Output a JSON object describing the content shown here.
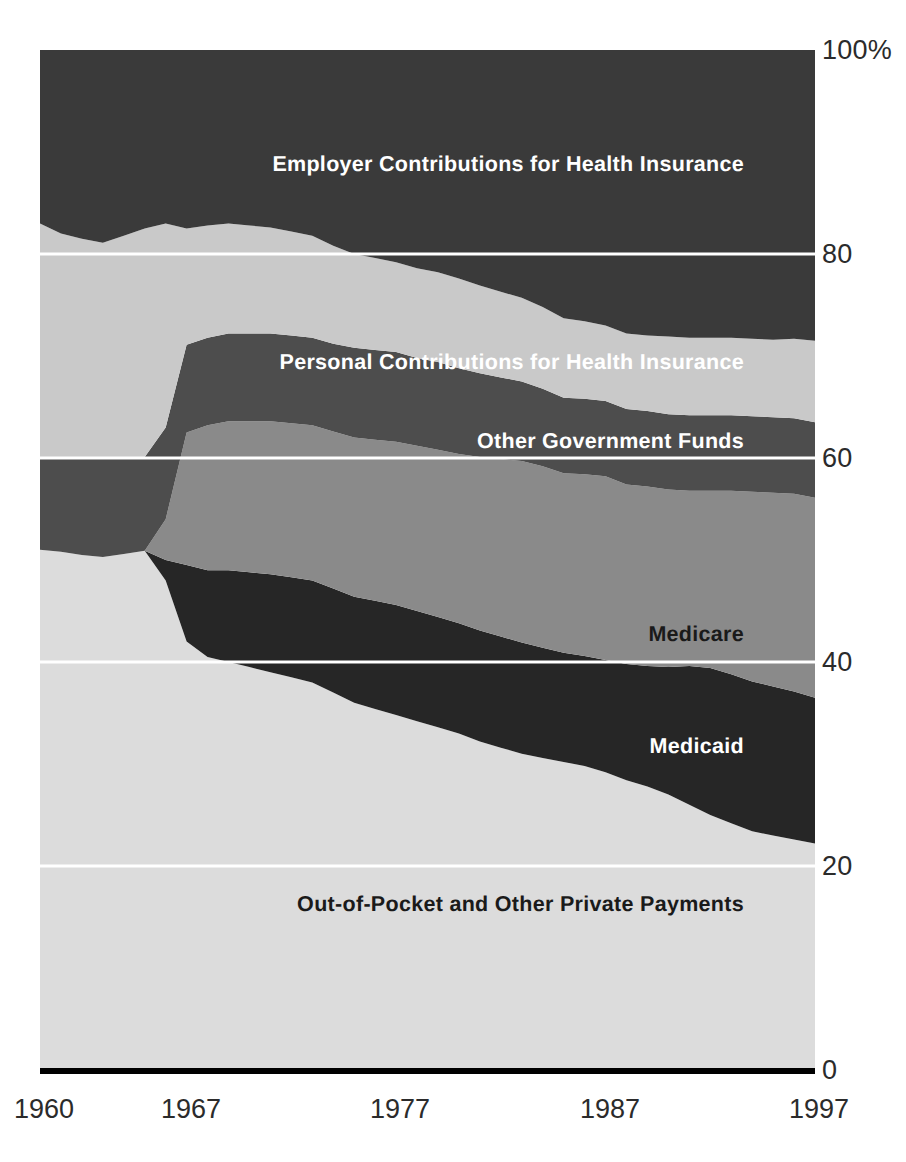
{
  "chart_data": {
    "type": "area",
    "title": "",
    "subtitle": "",
    "xlabel": "",
    "ylabel": "",
    "stacked": true,
    "stack_order": "bottom-to-top",
    "grid": true,
    "legend_position": "inline-labels",
    "xlim": [
      1960,
      1997
    ],
    "ylim": [
      0,
      100
    ],
    "x": [
      1960,
      1961,
      1962,
      1963,
      1964,
      1965,
      1966,
      1967,
      1968,
      1969,
      1970,
      1971,
      1972,
      1973,
      1974,
      1975,
      1976,
      1977,
      1978,
      1979,
      1980,
      1981,
      1982,
      1983,
      1984,
      1985,
      1986,
      1987,
      1988,
      1989,
      1990,
      1991,
      1992,
      1993,
      1994,
      1995,
      1996,
      1997
    ],
    "series": [
      {
        "name": "Out-of-Pocket and Other Private Payments",
        "color": "#dcdcdc",
        "label_color": "#1a1a1a",
        "values": [
          51.0,
          50.8,
          50.5,
          50.3,
          50.6,
          50.9,
          48.0,
          42.0,
          40.5,
          40.0,
          39.5,
          39.0,
          38.5,
          38.0,
          37.0,
          36.0,
          35.4,
          34.8,
          34.2,
          33.6,
          33.0,
          32.2,
          31.6,
          31.0,
          30.6,
          30.2,
          29.8,
          29.2,
          28.4,
          27.8,
          27.0,
          26.0,
          25.0,
          24.2,
          23.4,
          23.0,
          22.6,
          22.2
        ]
      },
      {
        "name": "Medicaid",
        "color": "#262626",
        "label_color": "#ffffff",
        "values": [
          0.0,
          0.0,
          0.0,
          0.0,
          0.0,
          0.0,
          2.0,
          7.5,
          8.5,
          9.0,
          9.3,
          9.6,
          9.8,
          10.0,
          10.2,
          10.4,
          10.6,
          10.8,
          10.8,
          10.8,
          10.8,
          10.9,
          10.9,
          10.9,
          10.8,
          10.7,
          10.8,
          11.0,
          11.4,
          11.8,
          12.5,
          13.6,
          14.4,
          14.6,
          14.7,
          14.6,
          14.5,
          14.3
        ]
      },
      {
        "name": "Medicare",
        "color": "#8a8a8a",
        "label_color": "#1a1a1a",
        "values": [
          0.0,
          0.0,
          0.0,
          0.0,
          0.0,
          0.0,
          4.0,
          13.0,
          14.2,
          14.6,
          14.8,
          15.0,
          15.1,
          15.2,
          15.4,
          15.6,
          15.8,
          16.0,
          16.2,
          16.4,
          16.6,
          17.0,
          17.4,
          17.8,
          17.8,
          17.6,
          17.8,
          18.0,
          17.6,
          17.6,
          17.4,
          17.2,
          17.4,
          18.0,
          18.6,
          19.0,
          19.4,
          19.6
        ]
      },
      {
        "name": "Other Government Funds",
        "color": "#4d4d4d",
        "label_color": "#ffffff",
        "values": [
          9.0,
          9.2,
          9.4,
          9.6,
          9.4,
          9.2,
          9.0,
          8.6,
          8.6,
          8.6,
          8.6,
          8.6,
          8.6,
          8.6,
          8.6,
          8.8,
          8.8,
          8.8,
          8.6,
          8.6,
          8.4,
          8.2,
          8.0,
          7.8,
          7.6,
          7.4,
          7.4,
          7.4,
          7.4,
          7.4,
          7.4,
          7.4,
          7.4,
          7.4,
          7.4,
          7.4,
          7.4,
          7.4
        ]
      },
      {
        "name": "Personal Contributions for Health Insurance",
        "color": "#c9c9c9",
        "label_color": "#ffffff",
        "values": [
          23.0,
          22.0,
          21.6,
          21.2,
          21.8,
          22.4,
          20.0,
          11.4,
          11.0,
          10.8,
          10.6,
          10.4,
          10.2,
          10.0,
          9.6,
          9.2,
          9.0,
          8.8,
          8.8,
          8.8,
          8.8,
          8.6,
          8.4,
          8.2,
          8.0,
          7.8,
          7.6,
          7.4,
          7.4,
          7.4,
          7.6,
          7.6,
          7.6,
          7.6,
          7.6,
          7.6,
          7.8,
          8.0
        ]
      },
      {
        "name": "Employer Contributions for Health Insurance",
        "color": "#3a3a3a",
        "label_color": "#ffffff",
        "values": [
          17.0,
          18.0,
          18.5,
          18.9,
          18.2,
          17.5,
          17.0,
          17.5,
          17.2,
          17.0,
          17.2,
          17.4,
          17.8,
          18.2,
          19.2,
          20.0,
          20.4,
          20.8,
          21.4,
          21.8,
          22.4,
          23.1,
          23.7,
          24.3,
          25.2,
          26.3,
          26.6,
          27.0,
          27.8,
          28.0,
          28.1,
          28.2,
          28.2,
          28.2,
          28.3,
          28.4,
          28.3,
          28.5
        ]
      }
    ],
    "y_ticks": [
      {
        "value": 100,
        "label": "100%"
      },
      {
        "value": 80,
        "label": "80"
      },
      {
        "value": 60,
        "label": "60"
      },
      {
        "value": 40,
        "label": "40"
      },
      {
        "value": 20,
        "label": "20"
      },
      {
        "value": 0,
        "label": "0"
      }
    ],
    "x_ticks": [
      {
        "value": 1960,
        "label": "1960"
      },
      {
        "value": 1967,
        "label": "1967"
      },
      {
        "value": 1977,
        "label": "1977"
      },
      {
        "value": 1987,
        "label": "1987"
      },
      {
        "value": 1997,
        "label": "1997"
      }
    ],
    "inline_labels": [
      {
        "name": "Employer Contributions for Health Insurance",
        "x": 744,
        "y": 164,
        "align": "right",
        "tone": "light"
      },
      {
        "name": "Personal Contributions for Health Insurance",
        "x": 744,
        "y": 361,
        "align": "right",
        "tone": "light"
      },
      {
        "name": "Other Government Funds",
        "x": 744,
        "y": 440,
        "align": "right",
        "tone": "light"
      },
      {
        "name": "Medicare",
        "x": 744,
        "y": 633,
        "align": "right",
        "tone": "dark"
      },
      {
        "name": "Medicaid",
        "x": 744,
        "y": 745,
        "align": "right",
        "tone": "light"
      },
      {
        "name": "Out-of-Pocket and Other Private Payments",
        "x": 744,
        "y": 903,
        "align": "right",
        "tone": "dark"
      }
    ],
    "colors": {
      "gridline": "#ffffff",
      "baseline": "#000000",
      "background": "#ffffff",
      "axis_text": "#2b2b2b"
    }
  }
}
